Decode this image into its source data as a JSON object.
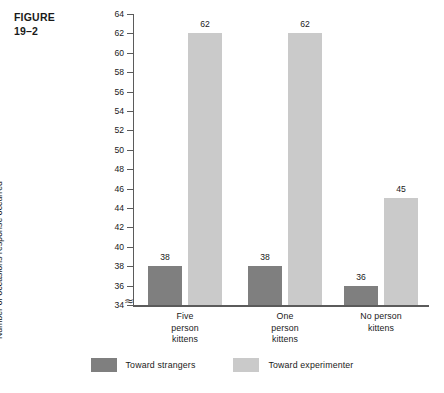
{
  "figure": {
    "label_line1": "FIGURE",
    "label_line2": "19–2"
  },
  "chart_data": {
    "type": "bar",
    "title": "",
    "xlabel": "",
    "ylabel": "Number of occasions response occurred",
    "categories": [
      "Five person kittens",
      "One person kittens",
      "No person kittens"
    ],
    "category_lines": [
      [
        "Five",
        "person",
        "kittens"
      ],
      [
        "One",
        "person",
        "kittens"
      ],
      [
        "No person",
        "kittens"
      ]
    ],
    "series": [
      {
        "name": "Toward strangers",
        "color": "#7f7f7f",
        "values": [
          38,
          38,
          36
        ]
      },
      {
        "name": "Toward experimenter",
        "color": "#cacaca",
        "values": [
          62,
          62,
          45
        ]
      }
    ],
    "ylim": [
      34,
      64
    ],
    "ytick_step": 2,
    "yticks": [
      34,
      36,
      38,
      40,
      42,
      44,
      46,
      48,
      50,
      52,
      54,
      56,
      58,
      60,
      62,
      64
    ],
    "axis_break": "≈",
    "axis_break_note": "y-axis broken below 34",
    "grid": false,
    "legend_position": "bottom"
  }
}
